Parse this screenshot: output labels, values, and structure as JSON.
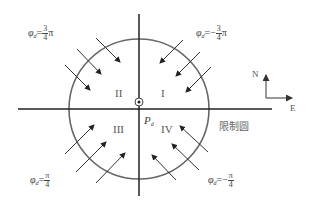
{
  "diagram": {
    "center_label": {
      "main": "P",
      "sub": "d"
    },
    "quadrants": [
      "I",
      "II",
      "III",
      "IV"
    ],
    "boundary_label": "限制圆",
    "compass": {
      "north": "N",
      "east": "E"
    },
    "angles": [
      {
        "id": "q2",
        "symbol": "φ",
        "sub": "d",
        "sign": "",
        "num": "3",
        "den": "4",
        "suffix": "π"
      },
      {
        "id": "q1",
        "symbol": "φ",
        "sub": "d",
        "sign": "−",
        "num": "3",
        "den": "4",
        "suffix": "π"
      },
      {
        "id": "q3",
        "symbol": "φ",
        "sub": "d",
        "sign": "",
        "num": "π",
        "den": "4",
        "suffix": ""
      },
      {
        "id": "q4",
        "symbol": "φ",
        "sub": "d",
        "sign": "−",
        "num": "π",
        "den": "4",
        "suffix": ""
      }
    ],
    "colors": {
      "axis": "#222222",
      "circle": "#666666",
      "arrow": "#333333"
    }
  }
}
